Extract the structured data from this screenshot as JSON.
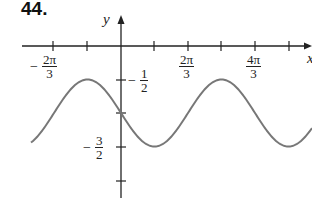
{
  "problem": {
    "number": "44."
  },
  "axes": {
    "x_label": "x",
    "y_label": "y",
    "x_tick_labels": [
      {
        "sign": "−",
        "num": "2π",
        "den": "3"
      },
      {
        "sign": "",
        "num": "2π",
        "den": "3"
      },
      {
        "sign": "",
        "num": "4π",
        "den": "3"
      }
    ],
    "y_tick_labels": [
      {
        "sign": "−",
        "num": "1",
        "den": "2"
      },
      {
        "sign": "−",
        "num": "3",
        "den": "2"
      }
    ]
  },
  "colors": {
    "axis": "#222222",
    "curve": "#777777",
    "background": "#ffffff"
  },
  "chart_data": {
    "type": "line",
    "title": "",
    "xlabel": "x",
    "ylabel": "y",
    "function": "y = -1 + (1/2)cos((3/2)(x + π/3))",
    "x_ticks": [
      "-2π/3",
      "-π/3",
      "0",
      "π/3",
      "2π/3",
      "π",
      "4π/3",
      "5π/3"
    ],
    "x_tick_labels_shown": [
      "-2π/3",
      "2π/3",
      "4π/3"
    ],
    "y_ticks": [
      -0.5,
      -1,
      -1.5,
      -2
    ],
    "y_tick_labels_shown": [
      "-1/2",
      "-3/2"
    ],
    "xlim": [
      -2.76,
      1.92
    ],
    "ylim": [
      -2.25,
      0.5
    ],
    "x_units": "π",
    "series": [
      {
        "name": "curve",
        "x": [
          "-0.85π",
          "-π/3",
          "0",
          "π/3",
          "π",
          "5π/3",
          "1.8π"
        ],
        "values": [
          -1.45,
          -0.5,
          -1,
          -1.5,
          -0.5,
          -1.5,
          -1.27
        ]
      }
    ],
    "key_points": {
      "maxima": [
        [
          "-π/3",
          -0.5
        ],
        [
          "π",
          -0.5
        ]
      ],
      "minima": [
        [
          "π/3",
          -1.5
        ],
        [
          "5π/3",
          -1.5
        ]
      ],
      "y_intercept": -1
    },
    "grid": false,
    "legend": "none"
  }
}
